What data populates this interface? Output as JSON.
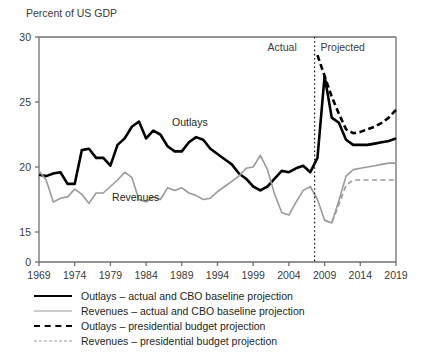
{
  "chart_data": {
    "type": "line",
    "title": "Percent of US GDP",
    "xlabel": "",
    "ylabel": "Percent of US GDP",
    "xlim": [
      1969,
      2019
    ],
    "ylim": [
      15,
      30
    ],
    "y_axis_break": true,
    "yticks": [
      "0",
      "15",
      "20",
      "25",
      "30"
    ],
    "ytick_values": [
      0,
      15,
      20,
      25,
      30
    ],
    "xticks": [
      "1969",
      "1974",
      "1979",
      "1984",
      "1989",
      "1994",
      "1999",
      "2004",
      "2009",
      "2014",
      "2019"
    ],
    "xtick_values": [
      1969,
      1974,
      1979,
      1984,
      1989,
      1994,
      1999,
      2004,
      2009,
      2014,
      2019
    ],
    "grid": false,
    "legend_position": "below",
    "divider": {
      "x_value": 2007.6,
      "style": "dotted",
      "left_label": "Actual",
      "right_label": "Projected"
    },
    "inline_annotations": [
      {
        "text": "Outlays",
        "x_value": 1991.0,
        "y_value": 23.4
      },
      {
        "text": "Revenues",
        "x_value": 1982.6,
        "y_value": 17.6
      }
    ],
    "series": [
      {
        "name": "Outlays – actual and CBO baseline projection",
        "short_name": "Outlays",
        "color": "#000000",
        "style": "solid",
        "width": 2.6,
        "x": [
          1969,
          1970,
          1971,
          1972,
          1973,
          1974,
          1975,
          1976,
          1977,
          1978,
          1979,
          1980,
          1981,
          1982,
          1983,
          1984,
          1985,
          1986,
          1987,
          1988,
          1989,
          1990,
          1991,
          1992,
          1993,
          1994,
          1995,
          1996,
          1997,
          1998,
          1999,
          2000,
          2001,
          2002,
          2003,
          2004,
          2005,
          2006,
          2007,
          2008,
          2009,
          2010,
          2011,
          2012,
          2013,
          2014,
          2015,
          2016,
          2017,
          2018,
          2019
        ],
        "y": [
          19.4,
          19.3,
          19.5,
          19.6,
          18.7,
          18.7,
          21.3,
          21.4,
          20.7,
          20.7,
          20.1,
          21.7,
          22.2,
          23.1,
          23.5,
          22.2,
          22.8,
          22.5,
          21.6,
          21.2,
          21.2,
          21.9,
          22.3,
          22.1,
          21.4,
          21.0,
          20.6,
          20.2,
          19.5,
          19.1,
          18.5,
          18.2,
          18.5,
          19.1,
          19.7,
          19.6,
          19.9,
          20.1,
          19.6,
          20.7,
          27.0,
          23.8,
          23.4,
          22.1,
          21.7,
          21.7,
          21.7,
          21.8,
          21.9,
          22.0,
          22.2
        ]
      },
      {
        "name": "Revenues – actual and CBO baseline projection",
        "short_name": "Revenues",
        "color": "#9a9a9a",
        "style": "solid",
        "width": 1.6,
        "x": [
          1969,
          1970,
          1971,
          1972,
          1973,
          1974,
          1975,
          1976,
          1977,
          1978,
          1979,
          1980,
          1981,
          1982,
          1983,
          1984,
          1985,
          1986,
          1987,
          1988,
          1989,
          1990,
          1991,
          1992,
          1993,
          1994,
          1995,
          1996,
          1997,
          1998,
          1999,
          2000,
          2001,
          2002,
          2003,
          2004,
          2005,
          2006,
          2007,
          2008,
          2009,
          2010,
          2011,
          2012,
          2013,
          2014,
          2015,
          2016,
          2017,
          2018,
          2019
        ],
        "y": [
          19.7,
          19.0,
          17.3,
          17.6,
          17.7,
          18.3,
          17.9,
          17.2,
          18.0,
          18.0,
          18.5,
          19.0,
          19.6,
          19.2,
          17.5,
          17.3,
          17.7,
          17.5,
          18.4,
          18.2,
          18.4,
          18.0,
          17.8,
          17.5,
          17.6,
          18.1,
          18.5,
          18.9,
          19.3,
          19.9,
          20.0,
          20.9,
          19.8,
          17.9,
          16.5,
          16.3,
          17.3,
          18.2,
          18.5,
          17.5,
          15.9,
          15.7,
          17.4,
          19.3,
          19.8,
          19.9,
          20.0,
          20.1,
          20.2,
          20.3,
          20.3
        ]
      },
      {
        "name": "Outlays – presidential budget projection",
        "short_name": "Outlays projected",
        "color": "#000000",
        "style": "dashed",
        "width": 2.6,
        "x": [
          2008,
          2009,
          2010,
          2011,
          2012,
          2013,
          2014,
          2015,
          2016,
          2017,
          2018,
          2019
        ],
        "y": [
          28.6,
          27.0,
          25.4,
          24.1,
          22.9,
          22.6,
          22.7,
          22.9,
          23.1,
          23.4,
          23.8,
          24.4
        ]
      },
      {
        "name": "Revenues – presidential budget projection",
        "short_name": "Revenues projected",
        "color": "#9a9a9a",
        "style": "dashed",
        "width": 1.6,
        "x": [
          2009,
          2010,
          2011,
          2012,
          2013,
          2014,
          2015,
          2016,
          2017,
          2018,
          2019
        ],
        "y": [
          15.9,
          15.7,
          17.1,
          18.6,
          19.0,
          19.0,
          19.0,
          19.0,
          19.0,
          19.0,
          19.0
        ]
      }
    ]
  },
  "legend": {
    "items": [
      {
        "label": "Outlays – actual and CBO baseline projection",
        "swatch": "sw-solid-black"
      },
      {
        "label": "Revenues – actual and CBO baseline projection",
        "swatch": "sw-solid-grey"
      },
      {
        "label": "Outlays – presidential budget projection",
        "swatch": "sw-dash-black"
      },
      {
        "label": "Revenues – presidential budget projection",
        "swatch": "sw-dash-grey"
      }
    ]
  },
  "colors": {
    "outlays": "#000000",
    "revenues": "#9a9a9a",
    "axis": "#6f6f6f",
    "text": "#231f20"
  }
}
